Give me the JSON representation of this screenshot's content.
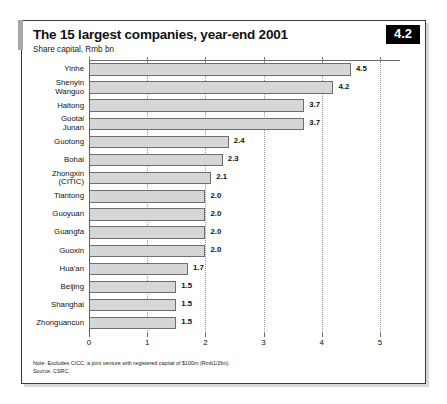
{
  "figure": {
    "number_badge": "4.2",
    "title": "The 15 largest companies, year-end 2001",
    "subtitle": "Share capital, Rmb bn",
    "note": "Note: Excludes CICC, a joint venture with registered capital of $100m (Rmb1/2bn).",
    "source": "Source: CSRC."
  },
  "chart_data": {
    "type": "bar",
    "orientation": "horizontal",
    "title": "The 15 largest companies, year-end 2001",
    "subtitle": "Share capital, Rmb bn",
    "xlabel": "",
    "ylabel": "",
    "xlim": [
      0,
      5
    ],
    "xticks": [
      0,
      1,
      2,
      3,
      4,
      5
    ],
    "xtick_labels": [
      "0",
      "1",
      "2",
      "3",
      "4",
      "5"
    ],
    "grid": true,
    "grid_style": "dotted-vertical",
    "legend": false,
    "bar_fill": "#d6d6d6",
    "bar_stroke": "#6e6e6e",
    "categories": [
      "Yinhe",
      "Shenyin\nWanguo",
      "Haitong",
      "Guotai\nJunan",
      "Guotong",
      "Bohai",
      "Zhongxin\n(CITIC)",
      "Tiantong",
      "Guoyuan",
      "Guangfa",
      "Guoxin",
      "Hua'an",
      "Beijing",
      "Shanghai",
      "Zhonguancun"
    ],
    "values": [
      4.5,
      4.2,
      3.7,
      3.7,
      2.4,
      2.3,
      2.1,
      2.0,
      2.0,
      2.0,
      2.0,
      1.7,
      1.5,
      1.5,
      1.5
    ],
    "value_labels": [
      "4.5",
      "4.2",
      "3.7",
      "3.7",
      "2.4",
      "2.3",
      "2.1",
      "2.0",
      "2.0",
      "2.0",
      "2.0",
      "1.7",
      "1.5",
      "1.5",
      "1.5"
    ],
    "units": "Rmb bn",
    "notes": [
      "Note: Excludes CICC, a joint venture with registered capital of $100m (Rmb1/2bn).",
      "Source: CSRC."
    ]
  }
}
